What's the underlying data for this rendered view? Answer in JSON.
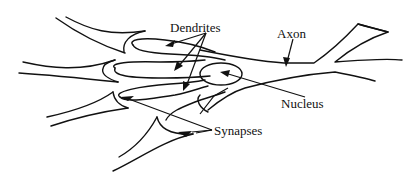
{
  "diagram": {
    "ink_color": "#111111",
    "background_color": "#ffffff",
    "labels": {
      "dendrites": "Dendrites",
      "axon": "Axon",
      "nucleus": "Nucleus",
      "synapses": "Synapses"
    },
    "parts": [
      "dendrites",
      "cell-body",
      "nucleus",
      "axon",
      "axon-terminal-branch",
      "synapses"
    ]
  }
}
